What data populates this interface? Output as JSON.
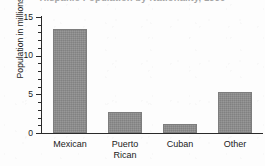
{
  "chart_data": {
    "type": "bar",
    "title": "Hispanic Population by Nationality, 1990",
    "xlabel": "",
    "ylabel": "Population in millions",
    "categories": [
      "Mexican",
      "Puerto\nRican",
      "Cuban",
      "Other"
    ],
    "values": [
      13.5,
      2.7,
      1.2,
      5.3
    ],
    "ylim": [
      0,
      15
    ],
    "yticks": [
      0,
      5,
      10,
      15
    ],
    "ytick_labels": [
      "0",
      "5",
      "10",
      "15"
    ],
    "minor_tick_interval": 1,
    "grid": false,
    "legend": null,
    "bar_color": "#8c8c8c",
    "axis_color": "#2a2a2a",
    "background": "#fdfdfd"
  }
}
